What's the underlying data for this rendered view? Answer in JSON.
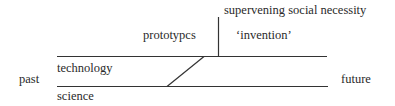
{
  "diagram": {
    "labels": {
      "supervening": "supervening social necessity",
      "prototypes": "prototypcs",
      "invention": "‘invention’",
      "technology": "technology",
      "past": "past",
      "future": "future",
      "science": "science"
    },
    "line_color": "#333333"
  }
}
